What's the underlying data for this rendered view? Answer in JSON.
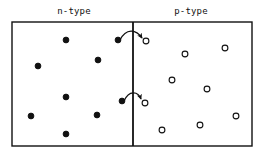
{
  "figure": {
    "title_left": "n-type",
    "title_right": "p-type",
    "colors": {
      "stroke": "#111111",
      "background": "#ffffff",
      "carrier_fill_electron": "#111111",
      "carrier_fill_hole": "#ffffff"
    },
    "box": {
      "x": 12,
      "y": 22,
      "width": 240,
      "height": 124,
      "stroke_width": 1.4
    },
    "junction_line": {
      "x": 133,
      "y1": 22,
      "y2": 146,
      "stroke_width": 1.8
    }
  },
  "chart_data": {
    "type": "scatter",
    "title": "",
    "xlabel": "",
    "ylabel": "",
    "xlim": [
      12,
      252
    ],
    "ylim": [
      22,
      146
    ],
    "grid": false,
    "legend": [
      {
        "name": "electron",
        "marker": "filled-circle",
        "region": "n-type"
      },
      {
        "name": "hole",
        "marker": "open-circle",
        "region": "p-type"
      }
    ],
    "annotations": [
      {
        "text": "n-type",
        "x": 74,
        "y": 13
      },
      {
        "text": "p-type",
        "x": 191,
        "y": 13
      }
    ],
    "series": [
      {
        "name": "electrons",
        "marker": "filled-circle",
        "radius": 2.9,
        "points": [
          {
            "x": 66,
            "y": 40
          },
          {
            "x": 118,
            "y": 40
          },
          {
            "x": 98,
            "y": 60
          },
          {
            "x": 38,
            "y": 66
          },
          {
            "x": 66,
            "y": 97
          },
          {
            "x": 31,
            "y": 116
          },
          {
            "x": 97,
            "y": 115
          },
          {
            "x": 66,
            "y": 134
          },
          {
            "x": 122,
            "y": 101
          }
        ]
      },
      {
        "name": "holes",
        "marker": "open-circle",
        "radius": 2.9,
        "points": [
          {
            "x": 146,
            "y": 41
          },
          {
            "x": 185,
            "y": 54
          },
          {
            "x": 225,
            "y": 48
          },
          {
            "x": 172,
            "y": 80
          },
          {
            "x": 207,
            "y": 89
          },
          {
            "x": 145,
            "y": 103
          },
          {
            "x": 236,
            "y": 116
          },
          {
            "x": 200,
            "y": 125
          },
          {
            "x": 162,
            "y": 130
          }
        ]
      }
    ],
    "arrows": [
      {
        "name": "carrier-crossing-top",
        "from": {
          "x": 120,
          "y": 40
        },
        "to": {
          "x": 143,
          "y": 41
        },
        "path": "M 120 40 C 126 28, 136 29, 142 38"
      },
      {
        "name": "carrier-crossing-bottom",
        "from": {
          "x": 124,
          "y": 101
        },
        "to": {
          "x": 142,
          "y": 102
        },
        "path": "M 124 101 C 129 90, 138 91, 141 99"
      }
    ]
  }
}
